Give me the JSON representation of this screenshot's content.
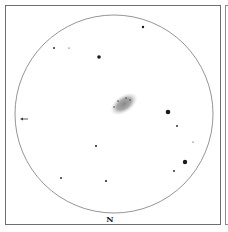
{
  "sketch": {
    "orientation_label": "N",
    "field_of_view": {
      "cx": 114,
      "cy": 114,
      "r": 99,
      "stroke": "#7a7a7a"
    },
    "galaxy": {
      "cx": 124,
      "cy": 104,
      "rx": 15,
      "ry": 8.5,
      "angle": -35
    },
    "direction_arrow": {
      "x1": 28,
      "y1": 119,
      "x2": 20,
      "y2": 119
    },
    "stars": [
      {
        "x": 143,
        "y": 27,
        "r": 1.2
      },
      {
        "x": 54,
        "y": 48,
        "r": 0.9
      },
      {
        "x": 69,
        "y": 48,
        "r": 0.6
      },
      {
        "x": 99,
        "y": 57,
        "r": 1.8
      },
      {
        "x": 168,
        "y": 112,
        "r": 2.3
      },
      {
        "x": 177,
        "y": 126,
        "r": 0.9
      },
      {
        "x": 193,
        "y": 142,
        "r": 0.6
      },
      {
        "x": 185,
        "y": 162,
        "r": 2.2
      },
      {
        "x": 174,
        "y": 171,
        "r": 0.9
      },
      {
        "x": 96,
        "y": 146,
        "r": 1.0
      },
      {
        "x": 61,
        "y": 178,
        "r": 0.9
      },
      {
        "x": 106,
        "y": 181,
        "r": 1.0
      }
    ]
  }
}
